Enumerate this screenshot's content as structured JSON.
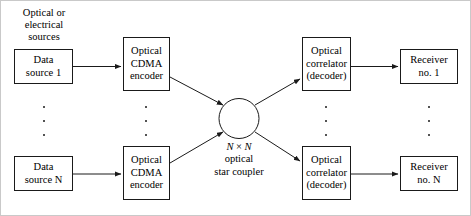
{
  "diagram": {
    "caption": {
      "line1": "Optical or",
      "line2": "electrical",
      "line3": "sources"
    },
    "nodes": {
      "data_source_1": {
        "line1": "Data",
        "line2": "source 1"
      },
      "data_source_n": {
        "line1": "Data",
        "line2": "source N"
      },
      "encoder_1": {
        "line1": "Optical",
        "line2": "CDMA",
        "line3": "encoder"
      },
      "encoder_n": {
        "line1": "Optical",
        "line2": "CDMA",
        "line3": "encoder"
      },
      "correlator_1": {
        "line1": "Optical",
        "line2": "correlator",
        "line3": "(decoder)"
      },
      "correlator_n": {
        "line1": "Optical",
        "line2": "correlator",
        "line3": "(decoder)"
      },
      "receiver_1": {
        "line1": "Receiver",
        "line2": "no. 1"
      },
      "receiver_n": {
        "line1": "Receiver",
        "line2": "no. N"
      }
    },
    "coupler": {
      "line1_prefix": "N",
      "line1_operator": " × ",
      "line1_suffix": "N",
      "line2": "optical",
      "line3": "star coupler"
    },
    "colors": {
      "stroke": "#1a1a1a",
      "background": "#ffffff",
      "frame": "#c9c9c9"
    }
  }
}
